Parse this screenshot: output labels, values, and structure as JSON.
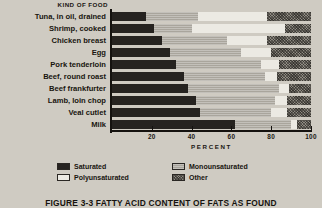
{
  "header": {
    "kind_of_food": "KIND OF FOOD"
  },
  "axis": {
    "title": "PERCENT",
    "ticks": [
      "20",
      "40",
      "60",
      "80",
      "100"
    ],
    "tick_values": [
      20,
      40,
      60,
      80,
      100
    ]
  },
  "legend": {
    "items": [
      {
        "label": "Saturated",
        "key": "saturated",
        "color": "#262320"
      },
      {
        "label": "Monounsaturated",
        "key": "monounsaturated",
        "color": "#a9a59c"
      },
      {
        "label": "Polyunsaturated",
        "key": "polyunsaturated",
        "color": "#eceae3"
      },
      {
        "label": "Other",
        "key": "other",
        "color": "#8e8a81"
      }
    ]
  },
  "caption": "FIGURE 3-3  FATTY ACID CONTENT OF FATS AS FOUND",
  "chart_data": {
    "type": "bar",
    "title": "FIGURE 3-3  FATTY ACID CONTENT OF FATS AS FOUND",
    "orientation": "horizontal",
    "stacked": true,
    "xlabel": "PERCENT",
    "ylabel": "KIND OF FOOD",
    "xlim": [
      0,
      100
    ],
    "grid": false,
    "legend_position": "bottom",
    "categories": [
      "Tuna, in oil, drained",
      "Shrimp, cooked",
      "Chicken breast",
      "Egg",
      "Pork tenderloin",
      "Beef, round roast",
      "Beef frankfurter",
      "Lamb, loin chop",
      "Veal cutlet",
      "Milk"
    ],
    "series": [
      {
        "name": "Saturated",
        "values": [
          17,
          21,
          25,
          29,
          32,
          36,
          38,
          42,
          44,
          62
        ]
      },
      {
        "name": "Monounsaturated",
        "values": [
          26,
          19,
          33,
          36,
          43,
          41,
          46,
          40,
          36,
          28
        ]
      },
      {
        "name": "Polyunsaturated",
        "values": [
          35,
          47,
          20,
          15,
          9,
          6,
          5,
          6,
          8,
          3
        ]
      },
      {
        "name": "Other",
        "values": [
          22,
          13,
          22,
          20,
          16,
          17,
          11,
          12,
          12,
          7
        ]
      }
    ]
  }
}
